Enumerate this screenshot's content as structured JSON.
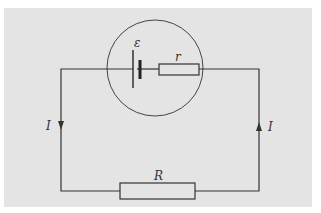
{
  "diagram": {
    "type": "circuit",
    "labels": {
      "emf": "ε",
      "internal_resistance": "r",
      "external_resistance": "R",
      "current_left": "I",
      "current_right": "I"
    },
    "colors": {
      "background": "#e4e4e4",
      "wire": "#333333"
    },
    "components": [
      {
        "name": "cell",
        "symbol": "ε"
      },
      {
        "name": "internal-resistor",
        "symbol": "r"
      },
      {
        "name": "external-resistor",
        "symbol": "R"
      }
    ],
    "currents": [
      {
        "side": "left",
        "direction": "down",
        "label": "I"
      },
      {
        "side": "right",
        "direction": "up",
        "label": "I"
      }
    ]
  }
}
